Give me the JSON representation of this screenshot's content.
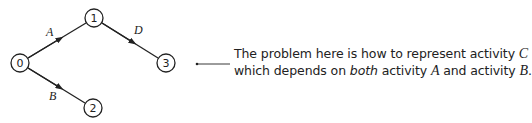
{
  "diagram": {
    "type": "activity-network",
    "nodes": [
      {
        "id": "0",
        "label": "0",
        "x": 20,
        "y": 63
      },
      {
        "id": "1",
        "label": "1",
        "x": 94,
        "y": 18
      },
      {
        "id": "2",
        "label": "2",
        "x": 93,
        "y": 108
      },
      {
        "id": "3",
        "label": "3",
        "x": 166,
        "y": 63
      }
    ],
    "edges": [
      {
        "from": "0",
        "to": "1",
        "label": "A"
      },
      {
        "from": "0",
        "to": "2",
        "label": "B"
      },
      {
        "from": "1",
        "to": "3",
        "label": "D"
      }
    ]
  },
  "annotation": {
    "line1_prefix": "The problem here is how to represent activity ",
    "line1_var": "C",
    "line2_prefix": "which depends on ",
    "line2_emph": "both",
    "line2_mid": " activity ",
    "line2_var1": "A",
    "line2_and": " and activity ",
    "line2_var2": "B",
    "line2_end": "."
  }
}
